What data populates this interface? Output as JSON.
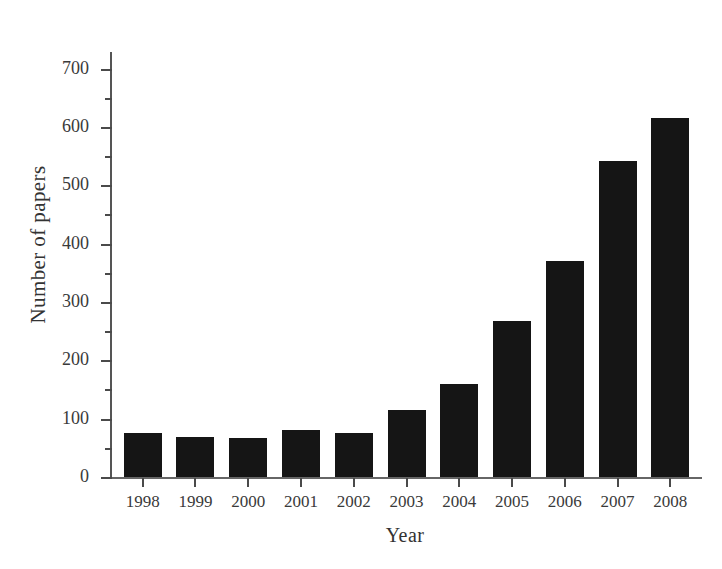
{
  "chart_data": {
    "type": "bar",
    "title": "",
    "xlabel": "Year",
    "ylabel": "Number of papers",
    "categories": [
      "1998",
      "1999",
      "2000",
      "2001",
      "2002",
      "2003",
      "2004",
      "2005",
      "2006",
      "2007",
      "2008"
    ],
    "values": [
      75,
      69,
      67,
      80,
      75,
      114,
      159,
      268,
      370,
      541,
      616
    ],
    "series": [
      {
        "name": "Number of papers",
        "values": [
          75,
          69,
          67,
          80,
          75,
          114,
          159,
          268,
          370,
          541,
          616
        ]
      }
    ],
    "ylim": [
      0,
      730
    ],
    "y_major_ticks": [
      0,
      100,
      200,
      300,
      400,
      500,
      600,
      700
    ],
    "y_minor_ticks": [
      50,
      150,
      250,
      350,
      450,
      550,
      650
    ],
    "y_tick_labels": [
      "0",
      "100",
      "200",
      "300",
      "400",
      "500",
      "600",
      "700"
    ],
    "grid": false,
    "legend": false,
    "legend_position": "none",
    "bar_color": "#151515",
    "axis_color": "#555555",
    "background_color": "#ffffff"
  }
}
